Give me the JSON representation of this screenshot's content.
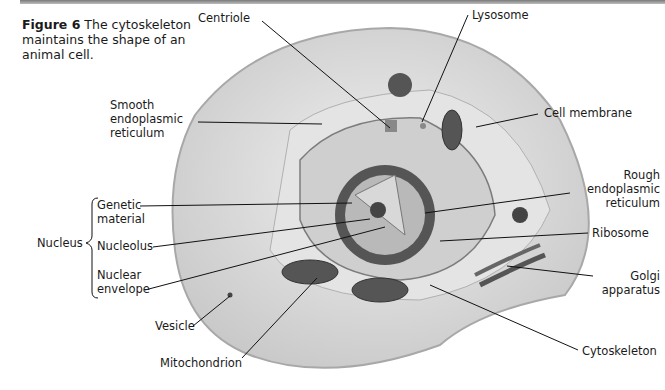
{
  "figure": {
    "number": "Figure 6",
    "caption": "The cytoskeleton maintains the shape of an animal cell."
  },
  "labels": {
    "centriole": "Centriole",
    "lysosome": "Lysosome",
    "smooth_er_1": "Smooth",
    "smooth_er_2": "endoplasmic",
    "smooth_er_3": "reticulum",
    "cell_membrane": "Cell membrane",
    "rough_er_1": "Rough",
    "rough_er_2": "endoplasmic",
    "rough_er_3": "reticulum",
    "ribosome": "Ribosome",
    "golgi_1": "Golgi",
    "golgi_2": "apparatus",
    "cytoskeleton": "Cytoskeleton",
    "mitochondrion": "Mitochondrion",
    "vesicle": "Vesicle",
    "nucleus": "Nucleus",
    "genetic_1": "Genetic",
    "genetic_2": "material",
    "nucleolus": "Nucleolus",
    "envelope_1": "Nuclear",
    "envelope_2": "envelope"
  }
}
